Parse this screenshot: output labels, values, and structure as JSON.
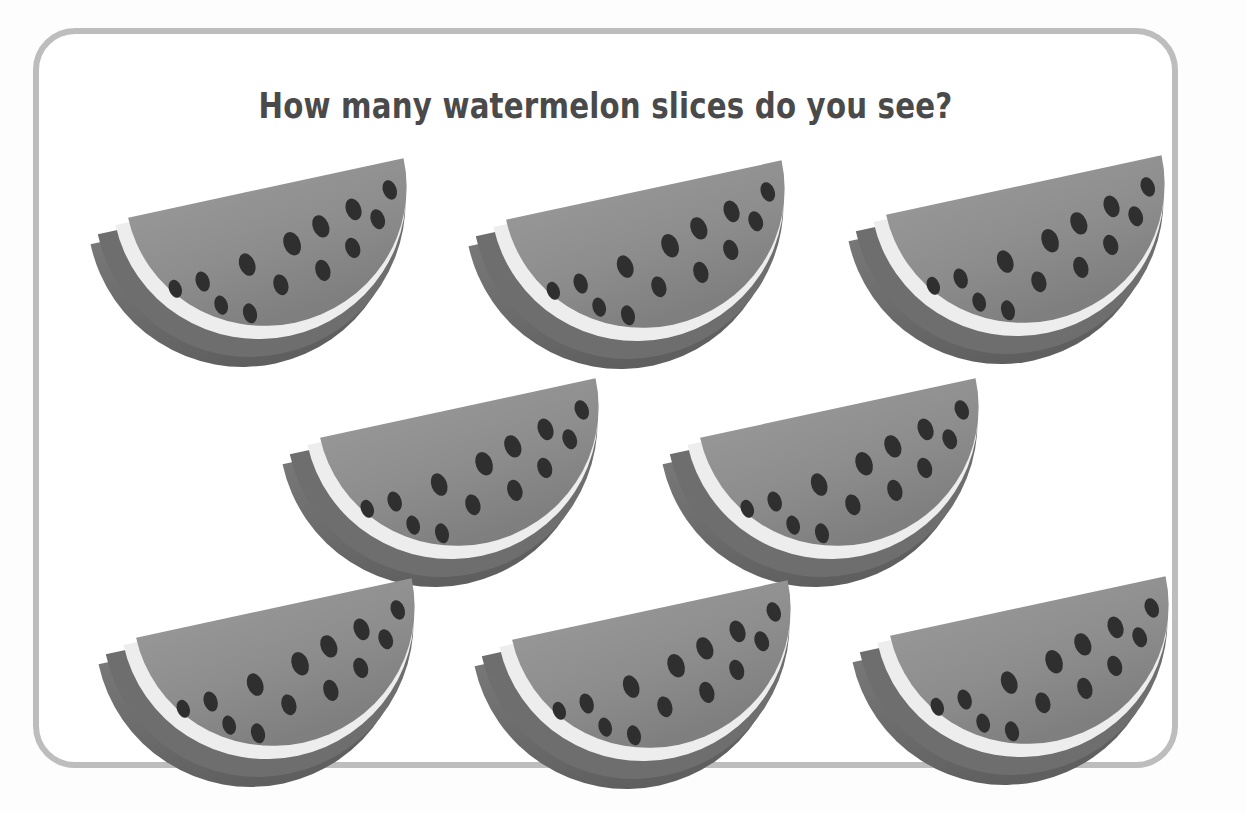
{
  "card": {
    "border_color": "#bdbdbd",
    "background_color": "#ffffff",
    "corner_radius_px": 42
  },
  "title": {
    "text": "How many watermelon slices do you see?",
    "color": "#4a4a4a"
  },
  "palette": {
    "page_background": "#fdfdfd",
    "flesh": "#8d8d8d",
    "flesh_shade": "#7f7f7f",
    "rind_light": "#ededed",
    "rind_dark": "#6e6e6e",
    "rind_side": "#5f5f5f",
    "seed": "#2f2f2f",
    "card_border": "#bdbdbd"
  },
  "counting_task": {
    "object_name": "watermelon slice",
    "total_count": 8,
    "seeds_per_slice": 13,
    "rows": [
      {
        "row_index": 1,
        "count": 3
      },
      {
        "row_index": 2,
        "count": 2
      },
      {
        "row_index": 3,
        "count": 3
      }
    ]
  },
  "slices": [
    {
      "id": "slice-1",
      "row": 1,
      "column": 1,
      "left": 50,
      "top": 148,
      "rotation_deg": -9
    },
    {
      "id": "slice-2",
      "row": 1,
      "column": 2,
      "left": 428,
      "top": 150,
      "rotation_deg": -9
    },
    {
      "id": "slice-3",
      "row": 1,
      "column": 3,
      "left": 808,
      "top": 145,
      "rotation_deg": -9
    },
    {
      "id": "slice-4",
      "row": 2,
      "column": 1,
      "left": 242,
      "top": 368,
      "rotation_deg": -9
    },
    {
      "id": "slice-5",
      "row": 2,
      "column": 2,
      "left": 622,
      "top": 368,
      "rotation_deg": -9
    },
    {
      "id": "slice-6",
      "row": 3,
      "column": 1,
      "left": 58,
      "top": 568,
      "rotation_deg": -9
    },
    {
      "id": "slice-7",
      "row": 3,
      "column": 2,
      "left": 434,
      "top": 570,
      "rotation_deg": -9
    },
    {
      "id": "slice-8",
      "row": 3,
      "column": 3,
      "left": 812,
      "top": 566,
      "rotation_deg": -9
    }
  ],
  "seed_positions": [
    {
      "cx": 88,
      "cy": 96,
      "rx": 6.5,
      "ry": 9.5,
      "rot": -12
    },
    {
      "cx": 117,
      "cy": 93,
      "rx": 7.0,
      "ry": 10.5,
      "rot": -10
    },
    {
      "cx": 132,
      "cy": 120,
      "rx": 6.8,
      "ry": 10.0,
      "rot": -8
    },
    {
      "cx": 160,
      "cy": 133,
      "rx": 7.0,
      "ry": 10.5,
      "rot": -6
    },
    {
      "cx": 165,
      "cy": 83,
      "rx": 8.0,
      "ry": 12.0,
      "rot": -12
    },
    {
      "cx": 196,
      "cy": 109,
      "rx": 7.5,
      "ry": 11.0,
      "rot": -8
    },
    {
      "cx": 214,
      "cy": 69,
      "rx": 8.5,
      "ry": 12.5,
      "rot": -12
    },
    {
      "cx": 241,
      "cy": 101,
      "rx": 7.6,
      "ry": 11.2,
      "rot": -8
    },
    {
      "cx": 246,
      "cy": 56,
      "rx": 8.2,
      "ry": 12.0,
      "rot": -14
    },
    {
      "cx": 275,
      "cy": 83,
      "rx": 7.4,
      "ry": 10.8,
      "rot": -10
    },
    {
      "cx": 282,
      "cy": 44,
      "rx": 7.8,
      "ry": 11.5,
      "rot": -12
    },
    {
      "cx": 305,
      "cy": 58,
      "rx": 7.2,
      "ry": 10.6,
      "rot": -10
    },
    {
      "cx": 322,
      "cy": 30,
      "rx": 7.0,
      "ry": 10.4,
      "rot": -12
    }
  ]
}
